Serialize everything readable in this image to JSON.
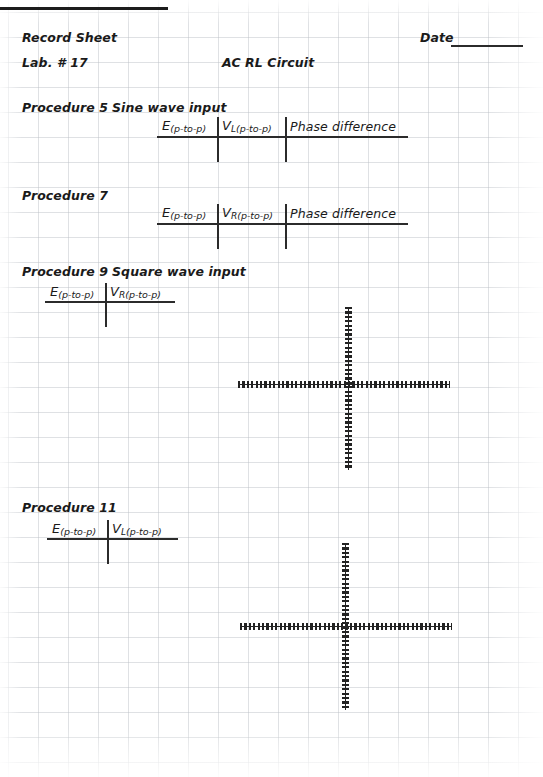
{
  "page": {
    "width": 543,
    "height": 777,
    "background_color": "#ffffff",
    "grid": {
      "line_color": "#b9bcc4",
      "col_spacing": 30,
      "row_spacing": 25,
      "origin_x": 8,
      "origin_y": 12
    },
    "ink_color": "#2b2b2b"
  },
  "header": {
    "record_sheet_label": "Record Sheet",
    "lab_label": "Lab. # 17",
    "experiment_title": "AC RL Circuit",
    "date_label": "Date",
    "date_value": ""
  },
  "procedures": [
    {
      "id": "procedure-5",
      "number_label": "Procedure 5",
      "subtitle": "Sine wave input",
      "columns": [
        {
          "symbol": "E",
          "subscript": "",
          "qualifier": "(p-to-p)"
        },
        {
          "symbol": "V",
          "subscript": "L",
          "qualifier": "(p-to-p)"
        },
        {
          "symbol": "Phase difference",
          "subscript": "",
          "qualifier": ""
        }
      ],
      "rows": [
        {
          "cells": [
            "",
            "",
            ""
          ]
        }
      ],
      "has_graph": false
    },
    {
      "id": "procedure-7",
      "number_label": "Procedure 7",
      "subtitle": "",
      "columns": [
        {
          "symbol": "E",
          "subscript": "",
          "qualifier": "(p-to-p)"
        },
        {
          "symbol": "V",
          "subscript": "R",
          "qualifier": "(p-to-p)"
        },
        {
          "symbol": "Phase difference",
          "subscript": "",
          "qualifier": ""
        }
      ],
      "rows": [
        {
          "cells": [
            "",
            "",
            ""
          ]
        }
      ],
      "has_graph": false
    },
    {
      "id": "procedure-9",
      "number_label": "Procedure 9",
      "subtitle": "Square wave input",
      "columns": [
        {
          "symbol": "E",
          "subscript": "",
          "qualifier": "(p-to-p)"
        },
        {
          "symbol": "V",
          "subscript": "R",
          "qualifier": "(p-to-p)"
        }
      ],
      "rows": [
        {
          "cells": [
            "",
            ""
          ]
        }
      ],
      "has_graph": true,
      "graph": {
        "type": "oscilloscope-axes",
        "x_axis_label": "",
        "y_axis_label": "",
        "trace": "",
        "center_x": 348,
        "center_y": 385,
        "x_min": 238,
        "x_max": 450,
        "y_min": 307,
        "y_max": 470
      }
    },
    {
      "id": "procedure-11",
      "number_label": "Procedure 11",
      "subtitle": "",
      "columns": [
        {
          "symbol": "E",
          "subscript": "",
          "qualifier": "(p-to-p)"
        },
        {
          "symbol": "V",
          "subscript": "L",
          "qualifier": "(p-to-p)"
        }
      ],
      "rows": [
        {
          "cells": [
            "",
            ""
          ]
        }
      ],
      "has_graph": true,
      "graph": {
        "type": "oscilloscope-axes",
        "x_axis_label": "",
        "y_axis_label": "",
        "trace": "",
        "center_x": 345,
        "center_y": 627,
        "x_min": 240,
        "x_max": 452,
        "y_min": 543,
        "y_max": 710
      }
    }
  ]
}
